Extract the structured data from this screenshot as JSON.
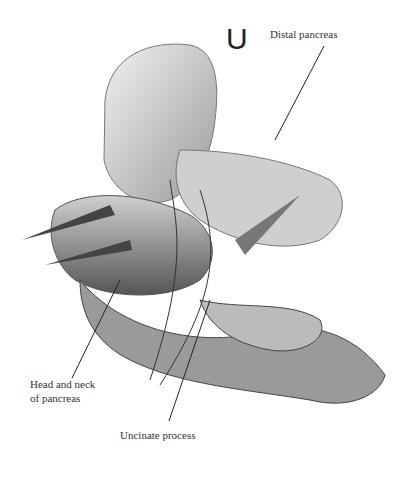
{
  "figure": {
    "panel_letter": "U",
    "labels": {
      "distal_pancreas": "Distal pancreas",
      "head_neck_1": "Head and neck",
      "head_neck_2": "of pancreas",
      "uncinate": "Uncinate process"
    }
  }
}
